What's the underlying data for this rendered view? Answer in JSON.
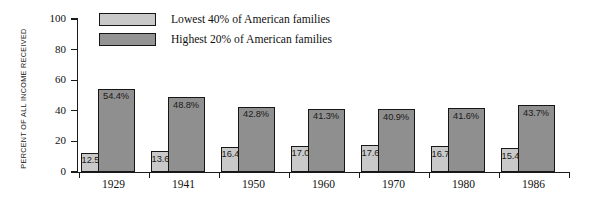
{
  "chart_data": {
    "type": "bar",
    "title": "",
    "subtitle": "",
    "xlabel": "",
    "ylabel": "PERCENT OF ALL INCOME RECEIVED",
    "ylim": [
      0,
      100
    ],
    "yticks": [
      0,
      20,
      40,
      60,
      80,
      100
    ],
    "ytick_labels": [
      "0",
      "20",
      "40",
      "60",
      "80",
      "100"
    ],
    "grid": false,
    "legend_position": "top-center",
    "categories": [
      "1929",
      "1941",
      "1950",
      "1960",
      "1970",
      "1980",
      "1986"
    ],
    "series": [
      {
        "name": "Lowest 40% of American families",
        "color": "#c9c9c9",
        "values": [
          12.5,
          13.6,
          16.4,
          17.0,
          17.6,
          16.7,
          15.4
        ],
        "labels": [
          "12.5%",
          "13.6%",
          "16.4%",
          "17.0%",
          "17.6%",
          "16.7%",
          "15.4%"
        ]
      },
      {
        "name": "Highest 20% of American families",
        "color": "#8f8f8f",
        "values": [
          54.4,
          48.8,
          42.8,
          41.3,
          40.9,
          41.6,
          43.7
        ],
        "labels": [
          "54.4%",
          "48.8%",
          "42.8%",
          "41.3%",
          "40.9%",
          "41.6%",
          "43.7%"
        ]
      }
    ]
  },
  "legend": {
    "items": [
      {
        "label": "Lowest 40% of American families",
        "swatch": "low"
      },
      {
        "label": "Highest 20% of American families",
        "swatch": "high"
      }
    ]
  },
  "colors": {
    "low": "#c9c9c9",
    "high": "#8f8f8f",
    "outline": "#161616",
    "background": "#ffffff"
  }
}
